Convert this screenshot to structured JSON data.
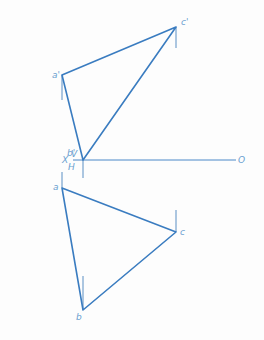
{
  "diagram": {
    "colors": {
      "line": "#3a7cc0",
      "axis": "#4a88c8",
      "projector": "#5b8fc4",
      "label": "#6a9fd0",
      "background": "#fdfdfd"
    },
    "axis": {
      "x_label": "X",
      "o_label": "O",
      "v_label": "V",
      "h_label": "H",
      "x1": 73,
      "x2": 236,
      "y": 160
    },
    "front_view": {
      "points": [
        {
          "name": "a'",
          "x": 62,
          "y": 75,
          "label": "a'",
          "lx": 52,
          "ly": 78
        },
        {
          "name": "b'",
          "x": 83,
          "y": 160,
          "label": "b'",
          "lx": 67,
          "ly": 156
        },
        {
          "name": "c'",
          "x": 176,
          "y": 27,
          "label": "c'",
          "lx": 181,
          "ly": 25
        }
      ],
      "projectors": [
        {
          "x": 62,
          "y1": 75,
          "y2": 100
        },
        {
          "x": 176,
          "y1": 27,
          "y2": 48
        },
        {
          "x": 83,
          "y1": 160,
          "y2": 178
        }
      ]
    },
    "top_view": {
      "points": [
        {
          "name": "a",
          "x": 62,
          "y": 188,
          "label": "a",
          "lx": 53,
          "ly": 190
        },
        {
          "name": "b",
          "x": 83,
          "y": 310,
          "label": "b",
          "lx": 76,
          "ly": 320
        },
        {
          "name": "c",
          "x": 176,
          "y": 232,
          "label": "c",
          "lx": 180,
          "ly": 235
        }
      ],
      "projectors": [
        {
          "x": 62,
          "y1": 172,
          "y2": 188
        },
        {
          "x": 176,
          "y1": 210,
          "y2": 232
        },
        {
          "x": 83,
          "y1": 276,
          "y2": 310
        }
      ]
    }
  }
}
